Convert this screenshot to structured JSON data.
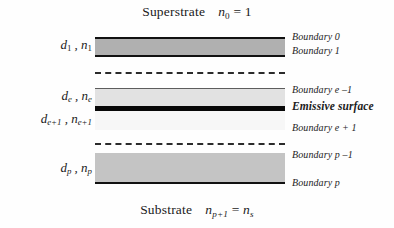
{
  "figure": {
    "type": "multilayer-thin-film-stack-diagram",
    "width": 394,
    "height": 228,
    "background_color": "#fefefe"
  },
  "media": {
    "superstrate": {
      "name": "Superstrate",
      "index_symbol": "n",
      "index_subscript": "0",
      "relation": "=",
      "index_value": "1",
      "full_text": "Superstrate   n0 = 1"
    },
    "substrate": {
      "name": "Substrate",
      "index_symbol": "n",
      "index_subscript": "p+1",
      "relation": "=",
      "index_value_symbol": "n",
      "index_value_subscript": "s",
      "full_text": "Substrate   np+1 = ns"
    }
  },
  "layers": [
    {
      "id": "layer-1",
      "thickness_symbol": "d",
      "thickness_subscript": "1",
      "index_symbol": "n",
      "index_subscript": "1",
      "label_text": "d1 , n1",
      "fill_color": "#b0b0b0",
      "top_px": 37,
      "height_px": 16
    },
    {
      "id": "layer-e",
      "thickness_symbol": "d",
      "thickness_subscript": "e",
      "index_symbol": "n",
      "index_subscript": "e",
      "label_text": "de , ne",
      "fill_color": "#e2e2e2",
      "top_px": 88,
      "height_px": 17
    },
    {
      "id": "layer-e-plus-1",
      "thickness_symbol": "d",
      "thickness_subscript": "e+1",
      "index_symbol": "n",
      "index_subscript": "e+1",
      "label_text": "de+1 , ne+1",
      "fill_color": "#f7f7f7",
      "top_px": 111,
      "height_px": 19
    },
    {
      "id": "layer-p",
      "thickness_symbol": "d",
      "thickness_subscript": "p",
      "index_symbol": "n",
      "index_subscript": "p",
      "label_text": "dp , np",
      "fill_color": "#c4c4c4",
      "top_px": 153,
      "height_px": 29
    }
  ],
  "boundaries": [
    {
      "id": "boundary-0",
      "label": "Boundary 0",
      "emphasis": "normal",
      "top_px": 31
    },
    {
      "id": "boundary-1",
      "label": "Boundary 1",
      "emphasis": "normal",
      "top_px": 45
    },
    {
      "id": "boundary-e-1",
      "label": "Boundary e –1",
      "emphasis": "normal",
      "top_px": 84
    },
    {
      "id": "emissive-surface",
      "label": "Emissive surface",
      "emphasis": "bold",
      "top_px": 100
    },
    {
      "id": "boundary-e+1",
      "label": "Boundary e + 1",
      "emphasis": "normal",
      "top_px": 122
    },
    {
      "id": "boundary-p-1",
      "label": "Boundary p –1",
      "emphasis": "normal",
      "top_px": 149
    },
    {
      "id": "boundary-p",
      "label": "Boundary p",
      "emphasis": "normal",
      "top_px": 177
    }
  ],
  "separators": [
    {
      "id": "dashed-upper",
      "style": "dashed",
      "top_px": 72,
      "color": "#2b2b2b"
    },
    {
      "id": "dashed-lower",
      "style": "dashed",
      "top_px": 143,
      "color": "#2b2b2b"
    }
  ],
  "emissive_surface": {
    "color": "#080808",
    "top_px": 106,
    "height_px": 5
  },
  "colors": {
    "line": "#111111",
    "thin_rule": "#5d5d5d",
    "text": "#1a1a1a",
    "layer_1_fill": "#b0b0b0",
    "layer_e_fill": "#e2e2e2",
    "layer_e_plus_1_fill": "#f7f7f7",
    "layer_p_fill": "#c4c4c4",
    "emissive_bar": "#080808"
  }
}
